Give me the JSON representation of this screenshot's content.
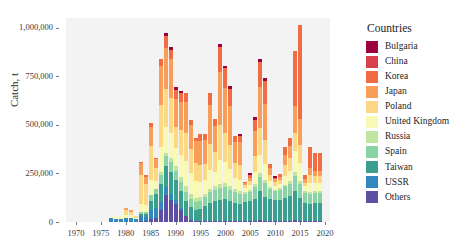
{
  "chart_data": {
    "type": "bar",
    "stacked": true,
    "title": "",
    "xlabel": "",
    "ylabel": "Catch, t",
    "xlim": [
      1968,
      2021
    ],
    "ylim": [
      0,
      1050000
    ],
    "yticks": [
      0,
      250000,
      500000,
      750000,
      1000000
    ],
    "ytick_labels": [
      "0",
      "250,000",
      "500,000",
      "750,000",
      "1,000,000"
    ],
    "xticks": [
      1970,
      1975,
      1980,
      1985,
      1990,
      1995,
      2000,
      2005,
      2010,
      2015,
      2020
    ],
    "xtick_labels": [
      "1970",
      "1975",
      "1980",
      "1985",
      "1990",
      "1995",
      "2000",
      "2005",
      "2010",
      "2015",
      "2020"
    ],
    "grid": false,
    "legend_position": "right",
    "legend_title": "Countries",
    "x": [
      1969,
      1970,
      1971,
      1972,
      1973,
      1974,
      1975,
      1976,
      1977,
      1978,
      1979,
      1980,
      1981,
      1982,
      1983,
      1984,
      1985,
      1986,
      1987,
      1988,
      1989,
      1990,
      1991,
      1992,
      1993,
      1994,
      1995,
      1996,
      1997,
      1998,
      1999,
      2000,
      2001,
      2002,
      2003,
      2004,
      2005,
      2006,
      2007,
      2008,
      2009,
      2010,
      2011,
      2012,
      2013,
      2014,
      2015,
      2016,
      2017,
      2018,
      2019
    ],
    "series": [
      {
        "name": "Others",
        "color": "#5e4fa2",
        "values": [
          0,
          0,
          0,
          0,
          0,
          0,
          0,
          0,
          2000,
          2000,
          2000,
          2000,
          2000,
          2000,
          3000,
          3000,
          14000,
          20000,
          60000,
          140000,
          115000,
          95000,
          60000,
          32000,
          10000,
          6000,
          6000,
          7000,
          7000,
          7000,
          7000,
          7000,
          6000,
          6000,
          6000,
          6000,
          6000,
          6000,
          9000,
          6000,
          6000,
          6000,
          5000,
          5000,
          5000,
          9000,
          5000,
          5000,
          5000,
          5000,
          5000
        ]
      },
      {
        "name": "USSR",
        "color": "#3288bd",
        "values": [
          1000,
          1000,
          1000,
          1000,
          1000,
          1000,
          1000,
          1000,
          18000,
          16000,
          12000,
          20000,
          20000,
          12000,
          30000,
          24000,
          50000,
          52000,
          42000,
          38000,
          30000,
          16000,
          10000,
          0,
          0,
          0,
          0,
          0,
          0,
          0,
          0,
          0,
          0,
          0,
          0,
          0,
          0,
          0,
          0,
          0,
          0,
          0,
          0,
          0,
          0,
          0,
          0,
          0,
          0,
          0,
          0
        ]
      },
      {
        "name": "Taiwan",
        "color": "#3a9f8f",
        "values": [
          0,
          0,
          0,
          0,
          0,
          0,
          0,
          0,
          0,
          0,
          0,
          0,
          0,
          3000,
          8000,
          12000,
          45000,
          70000,
          95000,
          110000,
          110000,
          105000,
          90000,
          78000,
          65000,
          58000,
          62000,
          75000,
          90000,
          100000,
          105000,
          110000,
          100000,
          92000,
          88000,
          95000,
          100000,
          115000,
          150000,
          125000,
          110000,
          105000,
          110000,
          120000,
          130000,
          150000,
          120000,
          95000,
          90000,
          95000,
          95000
        ]
      },
      {
        "name": "Spain",
        "color": "#89d3a5"
      },
      {
        "name": "Russia",
        "color": "#bfe5a0"
      },
      {
        "name": "United Kingdom",
        "color": "#f7f9b4"
      },
      {
        "name": "Poland",
        "color": "#fdd884"
      },
      {
        "name": "Japan",
        "color": "#f99e59"
      },
      {
        "name": "Korea",
        "color": "#f06d43"
      },
      {
        "name": "China",
        "color": "#d8414b"
      },
      {
        "name": "Bulgaria",
        "color": "#9e0142"
      }
    ],
    "stack_order_bottom_to_top": [
      "Others",
      "USSR",
      "Taiwan",
      "Spain",
      "Russia",
      "United Kingdom",
      "Poland",
      "Japan",
      "Korea",
      "China",
      "Bulgaria"
    ],
    "totals": [
      1000,
      1000,
      1000,
      1000,
      1000,
      1000,
      1000,
      1000,
      28000,
      30000,
      30000,
      70000,
      60000,
      30000,
      310000,
      240000,
      510000,
      330000,
      840000,
      975000,
      900000,
      695000,
      675000,
      665000,
      525000,
      435000,
      455000,
      455000,
      665000,
      530000,
      915000,
      805000,
      700000,
      445000,
      455000,
      205000,
      255000,
      540000,
      840000,
      740000,
      300000,
      235000,
      245000,
      385000,
      435000,
      880000,
      1015000,
      240000,
      385000,
      355000,
      355000
    ],
    "stacks": [
      {
        "year": 1969,
        "vals": [
          0,
          1000,
          0,
          0,
          0,
          0,
          0,
          0,
          0,
          0,
          0
        ]
      },
      {
        "year": 1970,
        "vals": [
          0,
          1000,
          0,
          0,
          0,
          0,
          0,
          0,
          0,
          0,
          0
        ]
      },
      {
        "year": 1971,
        "vals": [
          0,
          1000,
          0,
          0,
          0,
          0,
          0,
          0,
          0,
          0,
          0
        ]
      },
      {
        "year": 1972,
        "vals": [
          0,
          1000,
          0,
          0,
          0,
          0,
          0,
          0,
          0,
          0,
          0
        ]
      },
      {
        "year": 1973,
        "vals": [
          0,
          1000,
          0,
          0,
          0,
          0,
          0,
          0,
          0,
          0,
          0
        ]
      },
      {
        "year": 1974,
        "vals": [
          0,
          1000,
          0,
          0,
          0,
          0,
          0,
          0,
          0,
          0,
          0
        ]
      },
      {
        "year": 1975,
        "vals": [
          0,
          1000,
          0,
          0,
          0,
          0,
          0,
          0,
          0,
          0,
          0
        ]
      },
      {
        "year": 1976,
        "vals": [
          0,
          1000,
          0,
          0,
          0,
          0,
          0,
          0,
          0,
          0,
          0
        ]
      },
      {
        "year": 1977,
        "vals": [
          2000,
          18000,
          0,
          0,
          0,
          8000,
          0,
          0,
          0,
          0,
          0
        ]
      },
      {
        "year": 1978,
        "vals": [
          2000,
          16000,
          0,
          0,
          0,
          12000,
          0,
          0,
          0,
          0,
          0
        ]
      },
      {
        "year": 1979,
        "vals": [
          2000,
          12000,
          0,
          0,
          0,
          16000,
          0,
          0,
          0,
          0,
          0
        ]
      },
      {
        "year": 1980,
        "vals": [
          2000,
          20000,
          0,
          0,
          0,
          16000,
          24000,
          8000,
          0,
          0,
          0
        ]
      },
      {
        "year": 1981,
        "vals": [
          2000,
          20000,
          0,
          0,
          0,
          12000,
          20000,
          6000,
          0,
          0,
          0
        ]
      },
      {
        "year": 1982,
        "vals": [
          2000,
          12000,
          3000,
          0,
          0,
          5000,
          8000,
          0,
          0,
          0,
          0
        ]
      },
      {
        "year": 1983,
        "vals": [
          3000,
          30000,
          8000,
          12000,
          0,
          40000,
          150000,
          60000,
          7000,
          0,
          0
        ]
      },
      {
        "year": 1984,
        "vals": [
          3000,
          24000,
          12000,
          14000,
          0,
          35000,
          110000,
          35000,
          7000,
          0,
          0
        ]
      },
      {
        "year": 1985,
        "vals": [
          14000,
          50000,
          45000,
          30000,
          0,
          75000,
          175000,
          100000,
          21000,
          0,
          0
        ]
      },
      {
        "year": 1986,
        "vals": [
          20000,
          52000,
          70000,
          30000,
          0,
          38000,
          70000,
          42000,
          8000,
          0,
          0
        ]
      },
      {
        "year": 1987,
        "vals": [
          60000,
          42000,
          95000,
          45000,
          15000,
          130000,
          215000,
          200000,
          38000,
          0,
          0
        ]
      },
      {
        "year": 1988,
        "vals": [
          140000,
          38000,
          110000,
          50000,
          20000,
          130000,
          195000,
          215000,
          60000,
          0,
          17000
        ]
      },
      {
        "year": 1989,
        "vals": [
          115000,
          30000,
          110000,
          52000,
          25000,
          125000,
          180000,
          200000,
          48000,
          0,
          15000
        ]
      },
      {
        "year": 1990,
        "vals": [
          95000,
          16000,
          105000,
          48000,
          22000,
          95000,
          110000,
          145000,
          45000,
          0,
          14000
        ]
      },
      {
        "year": 1991,
        "vals": [
          60000,
          10000,
          90000,
          45000,
          25000,
          115000,
          130000,
          145000,
          42000,
          0,
          13000
        ]
      },
      {
        "year": 1992,
        "vals": [
          32000,
          0,
          78000,
          45000,
          28000,
          130000,
          145000,
          160000,
          47000,
          0,
          0
        ]
      },
      {
        "year": 1993,
        "vals": [
          10000,
          0,
          65000,
          45000,
          25000,
          110000,
          120000,
          125000,
          25000,
          0,
          0
        ]
      },
      {
        "year": 1994,
        "vals": [
          6000,
          0,
          58000,
          40000,
          22000,
          85000,
          95000,
          110000,
          19000,
          0,
          0
        ]
      },
      {
        "year": 1995,
        "vals": [
          6000,
          0,
          62000,
          42000,
          20000,
          75000,
          90000,
          120000,
          40000,
          0,
          0
        ]
      },
      {
        "year": 1996,
        "vals": [
          7000,
          0,
          75000,
          45000,
          18000,
          70000,
          85000,
          120000,
          35000,
          0,
          0
        ]
      },
      {
        "year": 1997,
        "vals": [
          7000,
          0,
          90000,
          55000,
          20000,
          95000,
          135000,
          200000,
          63000,
          0,
          0
        ]
      },
      {
        "year": 1998,
        "vals": [
          7000,
          0,
          100000,
          58000,
          18000,
          75000,
          100000,
          135000,
          37000,
          0,
          0
        ]
      },
      {
        "year": 1999,
        "vals": [
          7000,
          0,
          105000,
          62000,
          22000,
          125000,
          180000,
          270000,
          130000,
          0,
          14000
        ]
      },
      {
        "year": 2000,
        "vals": [
          7000,
          0,
          110000,
          65000,
          20000,
          105000,
          150000,
          235000,
          100000,
          0,
          13000
        ]
      },
      {
        "year": 2001,
        "vals": [
          6000,
          0,
          100000,
          60000,
          18000,
          90000,
          125000,
          200000,
          86000,
          0,
          15000
        ]
      },
      {
        "year": 2002,
        "vals": [
          6000,
          0,
          92000,
          55000,
          15000,
          60000,
          75000,
          110000,
          32000,
          0,
          0
        ]
      },
      {
        "year": 2003,
        "vals": [
          6000,
          0,
          88000,
          52000,
          14000,
          58000,
          78000,
          115000,
          30000,
          0,
          14000
        ]
      },
      {
        "year": 2004,
        "vals": [
          6000,
          0,
          95000,
          45000,
          10000,
          20000,
          15000,
          10000,
          4000,
          0,
          0
        ]
      },
      {
        "year": 2005,
        "vals": [
          6000,
          0,
          100000,
          48000,
          10000,
          25000,
          20000,
          18000,
          15000,
          0,
          13000
        ]
      },
      {
        "year": 2006,
        "vals": [
          6000,
          0,
          115000,
          60000,
          14000,
          60000,
          85000,
          130000,
          55000,
          0,
          15000
        ]
      },
      {
        "year": 2007,
        "vals": [
          9000,
          0,
          150000,
          75000,
          18000,
          95000,
          135000,
          215000,
          128000,
          0,
          15000
        ]
      },
      {
        "year": 2008,
        "vals": [
          6000,
          0,
          125000,
          68000,
          16000,
          85000,
          120000,
          190000,
          116000,
          0,
          14000
        ]
      },
      {
        "year": 2009,
        "vals": [
          6000,
          0,
          110000,
          55000,
          10000,
          30000,
          30000,
          35000,
          24000,
          0,
          0
        ]
      },
      {
        "year": 2010,
        "vals": [
          6000,
          0,
          105000,
          48000,
          8000,
          20000,
          18000,
          15000,
          5000,
          0,
          10000
        ]
      },
      {
        "year": 2011,
        "vals": [
          5000,
          0,
          110000,
          50000,
          8000,
          22000,
          20000,
          18000,
          12000,
          0,
          0
        ]
      },
      {
        "year": 2012,
        "vals": [
          5000,
          0,
          120000,
          58000,
          10000,
          45000,
          55000,
          50000,
          42000,
          0,
          0
        ]
      },
      {
        "year": 2013,
        "vals": [
          5000,
          0,
          130000,
          62000,
          12000,
          55000,
          65000,
          60000,
          46000,
          0,
          0
        ]
      },
      {
        "year": 2014,
        "vals": [
          9000,
          0,
          150000,
          80000,
          20000,
          105000,
          95000,
          140000,
          281000,
          0,
          0
        ]
      },
      {
        "year": 2015,
        "vals": [
          5000,
          0,
          120000,
          70000,
          18000,
          90000,
          95000,
          130000,
          487000,
          0,
          0
        ]
      },
      {
        "year": 2016,
        "vals": [
          5000,
          0,
          95000,
          48000,
          10000,
          25000,
          20000,
          18000,
          19000,
          0,
          0
        ]
      },
      {
        "year": 2017,
        "vals": [
          5000,
          0,
          90000,
          50000,
          12000,
          45000,
          40000,
          35000,
          108000,
          0,
          0
        ]
      },
      {
        "year": 2018,
        "vals": [
          5000,
          0,
          95000,
          48000,
          10000,
          42000,
          35000,
          30000,
          90000,
          0,
          0
        ]
      },
      {
        "year": 2019,
        "vals": [
          5000,
          0,
          95000,
          48000,
          10000,
          42000,
          35000,
          30000,
          90000,
          0,
          0
        ]
      }
    ]
  },
  "legend": {
    "title": "Countries",
    "items": [
      {
        "label": "Bulgaria",
        "color": "#9e0142"
      },
      {
        "label": "China",
        "color": "#d8414b"
      },
      {
        "label": "Korea",
        "color": "#f06d43"
      },
      {
        "label": "Japan",
        "color": "#f99e59"
      },
      {
        "label": "Poland",
        "color": "#fdd884"
      },
      {
        "label": "United Kingdom",
        "color": "#f7f9b4"
      },
      {
        "label": "Russia",
        "color": "#bfe5a0"
      },
      {
        "label": "Spain",
        "color": "#89d3a5"
      },
      {
        "label": "Taiwan",
        "color": "#3a9f8f"
      },
      {
        "label": "USSR",
        "color": "#3288bd"
      },
      {
        "label": "Others",
        "color": "#5e4fa2"
      }
    ]
  },
  "axes": {
    "ylabel": "Catch, t",
    "ytick_labels": [
      "1,000,000",
      "750,000",
      "500,000",
      "250,000",
      "0"
    ],
    "xtick_labels": [
      "1970",
      "1975",
      "1980",
      "1985",
      "1990",
      "1995",
      "2000",
      "2005",
      "2010",
      "2015",
      "2020"
    ]
  }
}
